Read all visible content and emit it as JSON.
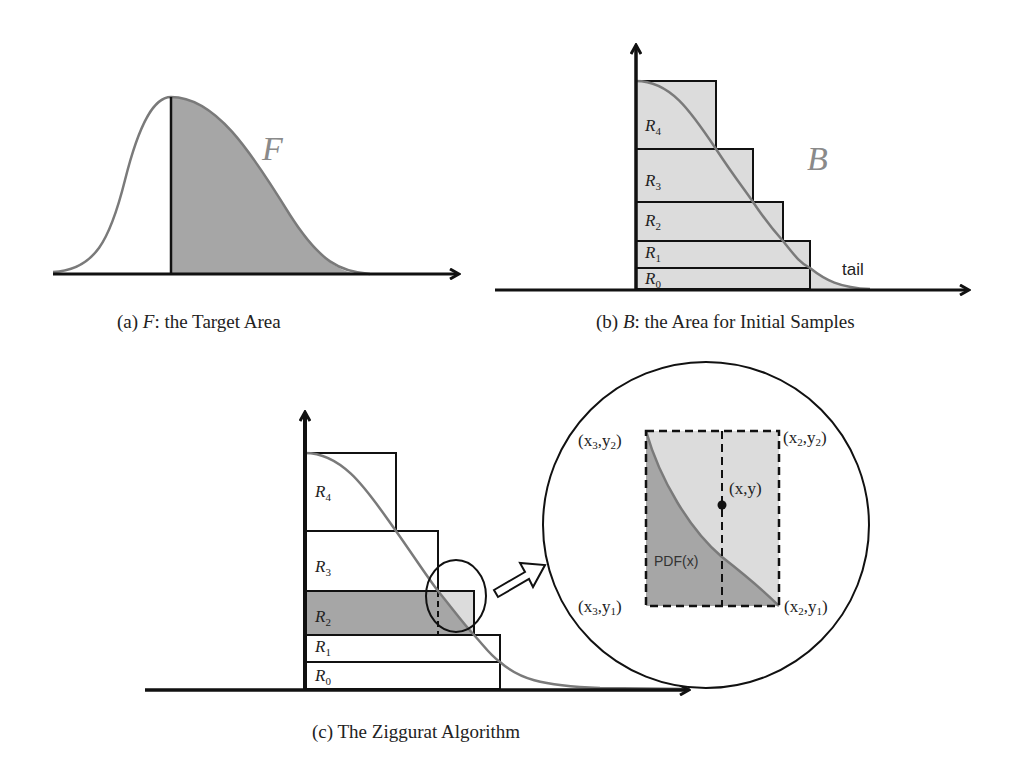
{
  "figure": {
    "panel_a": {
      "caption_prefix": "(a) ",
      "caption_var": "F",
      "caption_rest": ": the Target Area",
      "region_label": "F"
    },
    "panel_b": {
      "caption_prefix": "(b) ",
      "caption_var": "B",
      "caption_rest": ": the Area for Initial Samples",
      "region_label": "B",
      "tail_label": "tail",
      "rect_labels": [
        {
          "base": "R",
          "sub": "4"
        },
        {
          "base": "R",
          "sub": "3"
        },
        {
          "base": "R",
          "sub": "2"
        },
        {
          "base": "R",
          "sub": "1"
        },
        {
          "base": "R",
          "sub": "0"
        }
      ]
    },
    "panel_c": {
      "caption": "(c) The Ziggurat Algorithm",
      "rect_labels": [
        {
          "base": "R",
          "sub": "4"
        },
        {
          "base": "R",
          "sub": "3"
        },
        {
          "base": "R",
          "sub": "2"
        },
        {
          "base": "R",
          "sub": "1"
        },
        {
          "base": "R",
          "sub": "0"
        }
      ],
      "zoom": {
        "top_left": {
          "a": "(x",
          "a_sub": "3",
          "b": ",y",
          "b_sub": "2",
          "c": ")"
        },
        "top_right": {
          "a": "(x",
          "a_sub": "2",
          "b": ",y",
          "b_sub": "2",
          "c": ")"
        },
        "bottom_left": {
          "a": "(x",
          "a_sub": "3",
          "b": ",y",
          "b_sub": "1",
          "c": ")"
        },
        "bottom_right": {
          "a": "(x",
          "a_sub": "2",
          "b": ",y",
          "b_sub": "1",
          "c": ")"
        },
        "point_label": "(x,y)",
        "curve_label": "PDF(x)"
      }
    },
    "colors": {
      "curve": "#7a7a7a",
      "dark_fill": "#a6a6a6",
      "light_fill": "#dcdcdc",
      "stroke": "#111111"
    }
  }
}
